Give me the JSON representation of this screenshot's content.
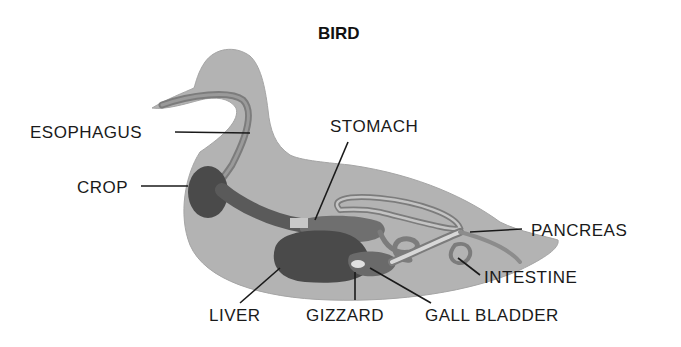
{
  "diagram": {
    "title": "BIRD",
    "colors": {
      "body": "#b3b3b3",
      "body_edge": "#a5a5a5",
      "organ_dark": "#4a4a4a",
      "organ_mid": "#7c7c7c",
      "organ_light": "#d8d8d8",
      "leader_line": "#1a1a1a",
      "text": "#1a1a1a"
    },
    "labels": {
      "esophagus": "ESOPHAGUS",
      "crop": "CROP",
      "stomach": "STOMACH",
      "pancreas": "PANCREAS",
      "intestine": "INTESTINE",
      "liver": "LIVER",
      "gizzard": "GIZZARD",
      "gall_bladder": "GALL BLADDER"
    }
  }
}
